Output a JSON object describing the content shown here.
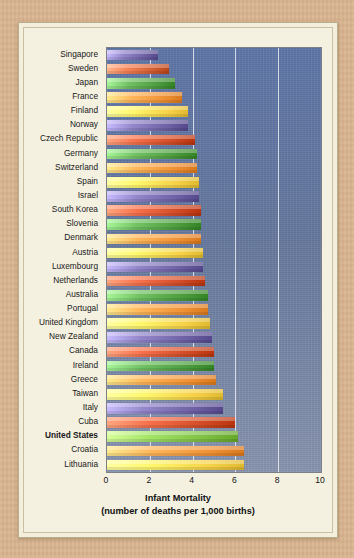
{
  "chart_data": {
    "type": "bar",
    "orientation": "horizontal",
    "title": "Infant Mortality",
    "subtitle": "(number of deaths per 1,000 births)",
    "xlabel": "Infant Mortality (number of deaths per 1,000 births)",
    "ylabel": "",
    "xlim": [
      0,
      10
    ],
    "xticks": [
      "0",
      "2",
      "4",
      "6",
      "8",
      "10"
    ],
    "xtick_values": [
      0,
      2,
      4,
      6,
      8,
      10
    ],
    "grid": "vertical gridlines at 2, 4, 6, 8",
    "legend": "none",
    "highlight": "United States",
    "plot_background": "#66799f",
    "categories": [
      "Singapore",
      "Sweden",
      "Japan",
      "France",
      "Finland",
      "Norway",
      "Czech Republic",
      "Germany",
      "Switzerland",
      "Spain",
      "Israel",
      "South Korea",
      "Slovenia",
      "Denmark",
      "Austria",
      "Luxembourg",
      "Netherlands",
      "Australia",
      "Portugal",
      "United Kingdom",
      "New Zealand",
      "Canada",
      "Ireland",
      "Greece",
      "Taiwan",
      "Italy",
      "Cuba",
      "United States",
      "Croatia",
      "Lithuania"
    ],
    "values": [
      2.4,
      2.9,
      3.2,
      3.5,
      3.8,
      3.8,
      4.1,
      4.2,
      4.2,
      4.3,
      4.3,
      4.4,
      4.4,
      4.4,
      4.5,
      4.5,
      4.6,
      4.7,
      4.7,
      4.8,
      4.9,
      5.0,
      5.0,
      5.1,
      5.4,
      5.4,
      6.0,
      6.1,
      6.4,
      6.4
    ],
    "bar_colors": [
      "#6b5ea3",
      "#cf5a2e",
      "#4a9a3c",
      "#ef8f33",
      "#f5cf45",
      "#6b5ea3",
      "#cf4a24",
      "#4a9a3c",
      "#ef8f33",
      "#f5cf45",
      "#6b5ea3",
      "#cf4a24",
      "#4a9a3c",
      "#ef8f33",
      "#f5cf45",
      "#6b5ea3",
      "#cf4a24",
      "#4a9a3c",
      "#ef8f33",
      "#f5cf45",
      "#6b5ea3",
      "#cf4a24",
      "#4a9a3c",
      "#ef8f33",
      "#f5cf45",
      "#6b5ea3",
      "#cf4a24",
      "#7bbd3f",
      "#ef8f33",
      "#f5cf45"
    ]
  },
  "axis": {
    "title_line1": "Infant Mortality",
    "title_line2": "(number of deaths per 1,000 births)"
  }
}
